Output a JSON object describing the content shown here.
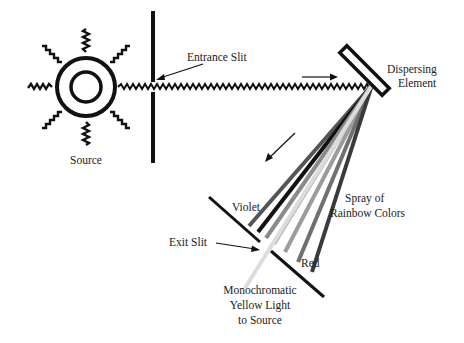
{
  "diagram": {
    "labels": {
      "source": "Source",
      "entrance_slit": "Entrance Slit",
      "dispersing_element_line1": "Dispersing",
      "dispersing_element_line2": "Element",
      "spray_line1": "Spray of",
      "spray_line2": "Rainbow Colors",
      "violet": "Violet",
      "red": "Red",
      "exit_slit": "Exit Slit",
      "output_line1": "Monochromatic",
      "output_line2": "Yellow Light",
      "output_line3": "to Source"
    },
    "colors": {
      "line": "#111111",
      "ray_dark": "#222222",
      "ray_mid": "#6a6a6a",
      "ray_light": "#9a9a9a",
      "ray_pale": "#cfcfcf"
    },
    "rays": [
      {
        "name": "violet",
        "shade": "#555555"
      },
      {
        "name": "indigo",
        "shade": "#111111"
      },
      {
        "name": "blue",
        "shade": "#8a8a8a"
      },
      {
        "name": "green",
        "shade": "#b0b0b0"
      },
      {
        "name": "yellow",
        "shade": "#dcdcdc"
      },
      {
        "name": "orange",
        "shade": "#9c9c9c"
      },
      {
        "name": "red-orange",
        "shade": "#707070"
      },
      {
        "name": "red",
        "shade": "#3a3a3a"
      }
    ]
  }
}
